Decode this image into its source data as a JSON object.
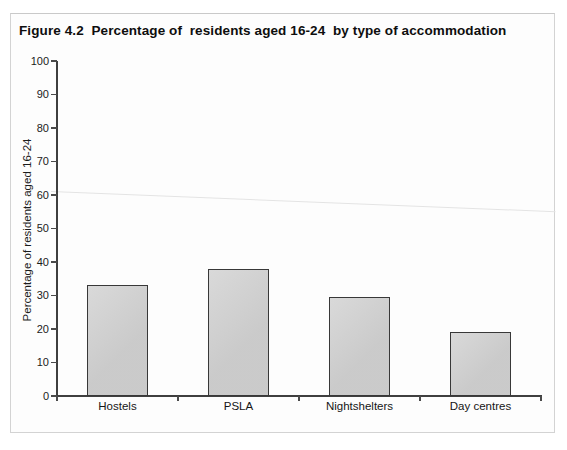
{
  "figure": {
    "title": "Figure 4.2  Percentage of  residents aged 16-24  by type of accommodation"
  },
  "chart_data": {
    "type": "bar",
    "title": "Figure 4.2 Percentage of residents aged 16-24 by type of accommodation",
    "categories": [
      "Hostels",
      "PSLA",
      "Nightshelters",
      "Day centres"
    ],
    "values": [
      33,
      38,
      29.5,
      19
    ],
    "xlabel": "",
    "ylabel": "Percentage of residents aged 16-24",
    "ylim": [
      0,
      100
    ],
    "yticks": [
      0,
      10,
      20,
      30,
      40,
      50,
      60,
      70,
      80,
      90,
      100
    ],
    "grid": false,
    "legend": false,
    "colors": {
      "bar_fill": "#d1d1d1",
      "bar_border": "#383838",
      "axis": "#3f3f3f",
      "text": "#1b1b1b",
      "frame_border": "#d3d3d3",
      "background": "#fdfdfd"
    }
  }
}
